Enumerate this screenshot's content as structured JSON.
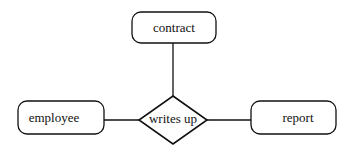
{
  "diagram": {
    "type": "entity-relationship",
    "entities": [
      {
        "id": "contract",
        "label": "contract"
      },
      {
        "id": "employee",
        "label": "employee"
      },
      {
        "id": "report",
        "label": "report"
      }
    ],
    "relationship": {
      "id": "writes-up",
      "label": "writes up"
    },
    "connections": [
      {
        "from": "writes-up",
        "to": "contract"
      },
      {
        "from": "writes-up",
        "to": "employee"
      },
      {
        "from": "writes-up",
        "to": "report"
      }
    ],
    "colors": {
      "stroke": "#111111",
      "fill": "#ffffff"
    }
  }
}
